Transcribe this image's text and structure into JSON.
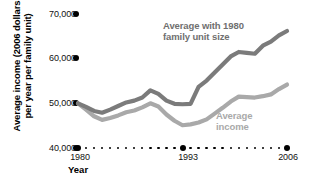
{
  "chart_data": {
    "type": "line",
    "title": "",
    "xlabel": "Year",
    "ylabel": "Average income (2006 dollars per year per family unit)",
    "ylabel_line1": "Average income (2006 dollars",
    "ylabel_line2": "per year per family unit)",
    "ylim": [
      40000,
      70000
    ],
    "yticks": [
      70000,
      60000,
      50000,
      40000
    ],
    "ytick_labels": [
      "70,000",
      "60,000",
      "50,000",
      "40,000"
    ],
    "xlim": [
      1980,
      2006
    ],
    "xticks": [
      1980,
      1993,
      2006
    ],
    "xtick_labels": [
      "1980",
      "1993",
      "2006"
    ],
    "grid": false,
    "legend_position": "inline-annotations",
    "x": [
      1980,
      1981,
      1982,
      1983,
      1984,
      1985,
      1986,
      1987,
      1988,
      1989,
      1990,
      1991,
      1992,
      1993,
      1994,
      1995,
      1996,
      1997,
      1998,
      1999,
      2000,
      2001,
      2002,
      2003,
      2004,
      2005,
      2006
    ],
    "series": [
      {
        "name": "Average with 1980 family unit size",
        "color": "#7b7b7b",
        "label_line1": "Average with 1980",
        "label_line2": "family unit size",
        "values": [
          50000,
          49200,
          48300,
          47900,
          48600,
          49400,
          50200,
          50600,
          51300,
          52900,
          52100,
          50600,
          49900,
          49800,
          49900,
          53700,
          55100,
          56900,
          58700,
          60500,
          61500,
          61300,
          61100,
          62900,
          63800,
          65200,
          66200
        ]
      },
      {
        "name": "Average income",
        "color": "#a9a9a9",
        "label_line1": "Average",
        "label_line2": "income",
        "values": [
          50000,
          48600,
          47100,
          46300,
          46700,
          47300,
          48000,
          48400,
          49100,
          50000,
          49300,
          47500,
          46100,
          45100,
          45300,
          45700,
          46400,
          47700,
          49000,
          50400,
          51500,
          51400,
          51300,
          51600,
          52000,
          53200,
          54200
        ]
      }
    ],
    "baseline_marker_count": 27,
    "major_marker_years": [
      1980,
      1993,
      2006
    ],
    "accent_black": "#000000"
  }
}
